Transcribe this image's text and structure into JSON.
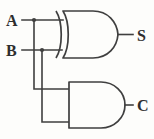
{
  "diagram": {
    "background_color": "#fdfdfb",
    "line_color": "#3f3f3f",
    "inputs": [
      {
        "id": "a",
        "label": "A",
        "y": 20
      },
      {
        "id": "b",
        "label": "B",
        "y": 50
      }
    ],
    "outputs": [
      {
        "id": "s",
        "label": "S",
        "y": 35,
        "from_gate": "xor"
      },
      {
        "id": "c",
        "label": "C",
        "y": 105,
        "from_gate": "and"
      }
    ],
    "gates": [
      {
        "id": "xor",
        "type": "XOR",
        "inputs": [
          "A",
          "B"
        ],
        "output": "S",
        "bounds": {
          "x": 57,
          "y": 11,
          "width": 61,
          "height": 47
        }
      },
      {
        "id": "and",
        "type": "AND",
        "inputs": [
          "A",
          "B"
        ],
        "output": "C",
        "bounds": {
          "x": 68,
          "y": 82,
          "width": 57,
          "height": 46
        }
      }
    ],
    "nets": [
      {
        "id": "net-a-main",
        "from": "A",
        "to": "xor.in1"
      },
      {
        "id": "net-a-branch",
        "from": "A",
        "to": "and.in1"
      },
      {
        "id": "net-b-main",
        "from": "B",
        "to": "xor.in2"
      },
      {
        "id": "net-b-branch",
        "from": "B",
        "to": "and.in2"
      }
    ],
    "junctions": [
      {
        "id": "junction-a",
        "x": 34,
        "y": 20,
        "on_net": "A"
      },
      {
        "id": "junction-b",
        "x": 42,
        "y": 50,
        "on_net": "B"
      }
    ]
  }
}
